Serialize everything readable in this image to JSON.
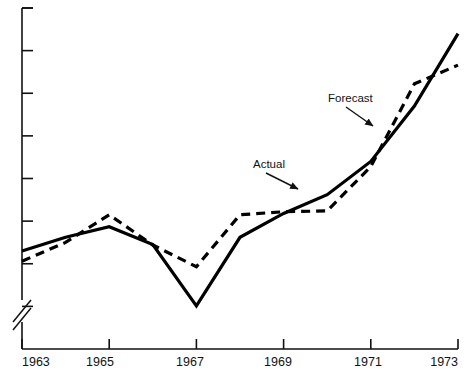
{
  "chart_data": {
    "type": "line",
    "title": "",
    "xlabel": "",
    "ylabel": "",
    "grid": false,
    "legend_position": "inline-annotations",
    "x": [
      1963,
      1964,
      1965,
      1966,
      1967,
      1968,
      1969,
      1970,
      1971,
      1972,
      1973
    ],
    "xlim": [
      1963,
      1973
    ],
    "x_tick_labels": [
      "1963",
      "1965",
      "1967",
      "1969",
      "1971",
      "1973"
    ],
    "x_tick_values": [
      1963,
      1965,
      1967,
      1969,
      1971,
      1973
    ],
    "x_minor_tick_values": [
      1964,
      1966,
      1968,
      1970,
      1972
    ],
    "ylim": [
      0,
      8
    ],
    "y_tick_labels": [
      "",
      "",
      "",
      "",
      "",
      "",
      "",
      ""
    ],
    "y_tick_values": [
      1,
      2,
      3,
      4,
      5,
      6,
      7,
      8
    ],
    "y_axis_break": true,
    "y_axis_break_symbol": "//",
    "series": [
      {
        "name": "Actual",
        "style": "solid",
        "color": "#000000",
        "width": 3.2,
        "values": [
          2.3,
          2.62,
          2.87,
          2.45,
          1.01,
          2.62,
          3.18,
          3.62,
          4.4,
          5.7,
          7.4
        ]
      },
      {
        "name": "Forecast",
        "style": "dashed",
        "color": "#000000",
        "width": 3.2,
        "dash": "9,6",
        "values": [
          2.06,
          2.5,
          3.15,
          2.44,
          1.93,
          3.15,
          3.22,
          3.24,
          4.28,
          6.22,
          6.66
        ]
      }
    ],
    "annotations": [
      {
        "text": "Actual",
        "target_series": "Actual",
        "label_x": 253,
        "label_y": 168,
        "arrow_from_x": 266,
        "arrow_from_y": 173,
        "arrow_to_x": 298,
        "arrow_to_y": 189
      },
      {
        "text": "Forecast",
        "target_series": "Forecast",
        "label_x": 328,
        "label_y": 102,
        "arrow_from_x": 346,
        "arrow_from_y": 107,
        "arrow_to_x": 373,
        "arrow_to_y": 126
      }
    ]
  },
  "axes": {
    "x_labels": [
      {
        "text": "1963",
        "px": 22
      },
      {
        "text": "1965",
        "px": 100
      },
      {
        "text": "1967",
        "px": 190
      },
      {
        "text": "1969",
        "px": 278
      },
      {
        "text": "1971",
        "px": 368
      },
      {
        "text": "1973",
        "px": 458
      }
    ]
  }
}
